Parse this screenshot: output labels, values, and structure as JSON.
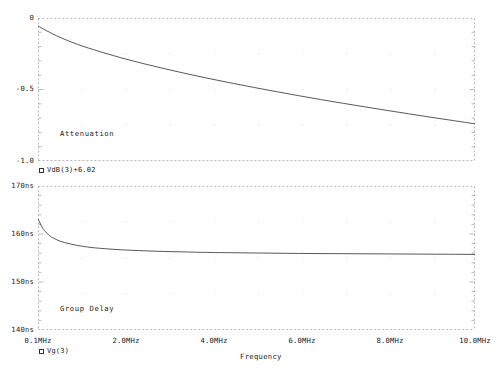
{
  "figure": {
    "title": "",
    "background": "#ffffff",
    "trace_color": "#3a3a3a",
    "axis_color": "#9a9aa8",
    "grid_color": "#c9c9d6"
  },
  "xaxis": {
    "label": "Frequency",
    "unit": "MHz",
    "min": 0.1,
    "max": 10.0,
    "ticks": [
      "0.1MHz",
      "2.0MHz",
      "4.0MHz",
      "6.0MHz",
      "8.0MHz",
      "10.0MHz"
    ],
    "tick_values": [
      0.1,
      2.0,
      4.0,
      6.0,
      8.0,
      10.0
    ]
  },
  "panels": [
    {
      "name": "attenuation",
      "annotation": "Attenuation",
      "legend": "VdB(3)+6.02",
      "legend_marker": "square-marker",
      "yticks": [
        "0",
        "-0.5",
        "-1.0"
      ],
      "ytick_values": [
        0,
        -0.5,
        -1.0
      ]
    },
    {
      "name": "group-delay",
      "annotation": "Group Delay",
      "legend": "Vg(3)",
      "legend_marker": "square-marker",
      "yticks": [
        "170ns",
        "160ns",
        "150ns",
        "140ns"
      ],
      "ytick_values": [
        170,
        160,
        150,
        140
      ]
    }
  ],
  "chart_data": [
    {
      "type": "line",
      "title": "Attenuation",
      "xlabel": "Frequency",
      "ylabel": "",
      "series_name": "VdB(3)+6.02",
      "xlim": [
        0.1,
        10.0
      ],
      "ylim": [
        -1.0,
        0.0
      ],
      "xticks": [
        0.1,
        2.0,
        4.0,
        6.0,
        8.0,
        10.0
      ],
      "xticklabels": [
        "0.1MHz",
        "2.0MHz",
        "4.0MHz",
        "6.0MHz",
        "8.0MHz",
        "10.0MHz"
      ],
      "yticks": [
        0.0,
        -0.5,
        -1.0
      ],
      "yticklabels": [
        "0",
        "-0.5",
        "-1.0"
      ],
      "grid": true,
      "legend_position": "below-axis-left",
      "x": [
        0.1,
        0.3,
        0.6,
        1.0,
        1.5,
        2.0,
        2.5,
        3.0,
        3.5,
        4.0,
        4.5,
        5.0,
        5.5,
        6.0,
        6.5,
        7.0,
        7.5,
        8.0,
        8.5,
        9.0,
        9.5,
        10.0
      ],
      "y": [
        -0.055,
        -0.09,
        -0.135,
        -0.185,
        -0.235,
        -0.28,
        -0.32,
        -0.357,
        -0.392,
        -0.425,
        -0.456,
        -0.486,
        -0.515,
        -0.543,
        -0.57,
        -0.596,
        -0.621,
        -0.646,
        -0.67,
        -0.694,
        -0.717,
        -0.74
      ]
    },
    {
      "type": "line",
      "title": "Group Delay",
      "xlabel": "Frequency",
      "ylabel": "",
      "series_name": "Vg(3)",
      "xlim": [
        0.1,
        10.0
      ],
      "ylim": [
        140,
        170
      ],
      "xticks": [
        0.1,
        2.0,
        4.0,
        6.0,
        8.0,
        10.0
      ],
      "xticklabels": [
        "0.1MHz",
        "2.0MHz",
        "4.0MHz",
        "6.0MHz",
        "8.0MHz",
        "10.0MHz"
      ],
      "yticks": [
        170,
        160,
        150,
        140
      ],
      "yticklabels": [
        "170ns",
        "160ns",
        "150ns",
        "140ns"
      ],
      "grid": true,
      "legend_position": "below-axis-left",
      "units": "ns",
      "x": [
        0.1,
        0.2,
        0.3,
        0.4,
        0.6,
        0.8,
        1.0,
        1.3,
        1.6,
        2.0,
        2.5,
        3.0,
        3.5,
        4.0,
        5.0,
        6.0,
        7.0,
        8.0,
        9.0,
        10.0
      ],
      "y": [
        163.2,
        161.3,
        160.2,
        159.4,
        158.5,
        158.0,
        157.6,
        157.2,
        156.95,
        156.7,
        156.5,
        156.35,
        156.25,
        156.15,
        156.05,
        155.95,
        155.9,
        155.85,
        155.8,
        155.75
      ]
    }
  ]
}
